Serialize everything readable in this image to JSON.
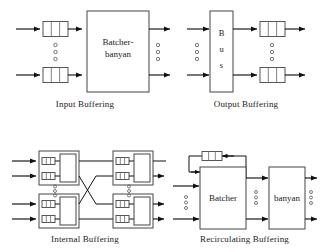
{
  "figure": {
    "background_color": "#ffffff",
    "line_color": "#111111",
    "box_stroke_color": "#555555",
    "text_color": "#1a1a1a"
  },
  "panels": [
    {
      "id": "input-buffering",
      "caption": "Input Buffering",
      "main_box_label": "Batcher-\nbanyan",
      "main_box_label_line1": "Batcher-",
      "main_box_label_line2": "banyan",
      "buffer_count": 2,
      "buffer_cells": 3,
      "input_count": 2,
      "output_count": 2,
      "vertical_ellipsis": "○○○"
    },
    {
      "id": "output-buffering",
      "caption": "Output Buffering",
      "main_box_label": "Bus",
      "main_box_label_letters": [
        "B",
        "u",
        "s"
      ],
      "buffer_count": 2,
      "buffer_cells": 3,
      "input_count": 2,
      "output_count": 2,
      "vertical_ellipsis": "○○○"
    },
    {
      "id": "internal-buffering",
      "caption": "Internal Buffering",
      "module_count": 4,
      "modules_per_stage": 2,
      "stages": 2,
      "buffers_per_module": 2,
      "buffer_cells": 2,
      "vertical_ellipsis": "○○○"
    },
    {
      "id": "recirculating-buffering",
      "caption": "Recirculating Buffering",
      "first_box_label": "Batcher",
      "second_box_label": "banyan",
      "feedback_buffer_cells": 3,
      "input_count": 2,
      "output_count": 2,
      "vertical_ellipsis": "○○○"
    }
  ],
  "captions": {
    "input": "Input Buffering",
    "output": "Output Buffering",
    "internal": "Internal Buffering",
    "recirculating": "Recirculating Buffering"
  },
  "labels": {
    "batcher_banyan_line1": "Batcher-",
    "batcher_banyan_line2": "banyan",
    "bus_b": "B",
    "bus_u": "u",
    "bus_s": "s",
    "batcher": "Batcher",
    "banyan": "banyan"
  }
}
